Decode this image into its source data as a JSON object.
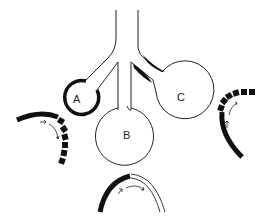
{
  "diagram": {
    "type": "alveolar-ventilation-schematic",
    "labels": {
      "a": "A",
      "b": "B",
      "c": "C"
    },
    "units": [
      {
        "id": "A",
        "description": "small alveolus with thick wall, narrow opening"
      },
      {
        "id": "B",
        "description": "large alveolus, normal thin wall"
      },
      {
        "id": "C",
        "description": "large alveolus with partially obstructed airway (dark thickening)"
      }
    ],
    "arc_insets": [
      {
        "position": "left",
        "description": "thick arc with segmented black blocks, arrows along curve"
      },
      {
        "position": "right",
        "description": "thick arc with segmented blocks at top, arrows along curve"
      },
      {
        "position": "bottom",
        "description": "half thick black arc, half double-line arc, curved arrow"
      }
    ],
    "colors": {
      "stroke": "#111111",
      "fill": "#111111",
      "background": "#ffffff"
    }
  }
}
